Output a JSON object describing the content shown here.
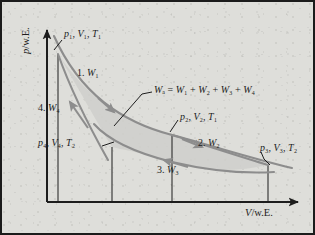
{
  "figure": {
    "kind": "carnot-cycle-pv-diagram",
    "background_color": "#dededa",
    "border_color": "#1b1b1b",
    "curve_color": "#8d8d8d",
    "axis_color": "#1d1d1d",
    "fill_color": "#cfcfcb"
  },
  "axes": {
    "y_label": "p/w.E.",
    "x_label": "V/w.E."
  },
  "states": {
    "p1": "p₁, V₁, T₁",
    "p2": "p₂, V₂, T₁",
    "p3": "p₃, V₃, T₂",
    "p4": "p₄, V₄, T₂"
  },
  "steps": {
    "w1": "1. W₁",
    "w2": "2. W₂",
    "w3": "3. W₃",
    "w4": "4. W₄"
  },
  "equation": "Wₐ = W₁ + W₂ + W₃ + W₄",
  "chart_data": {
    "type": "line",
    "xlabel": "V/w.E.",
    "ylabel": "p/w.E.",
    "grid": false,
    "legend": "none",
    "axis_origin_px": [
      45,
      200
    ],
    "points": [
      {
        "name": "1",
        "label": "p₁, V₁, T₁",
        "px": [
          56,
          52
        ]
      },
      {
        "name": "2",
        "label": "p₂, V₂, T₁",
        "px": [
          170,
          133
        ]
      },
      {
        "name": "3",
        "label": "p₃, V₃, T₂",
        "px": [
          266,
          163
        ]
      },
      {
        "name": "4",
        "label": "p₄, V₄, T₂",
        "px": [
          110,
          145
        ]
      }
    ],
    "series": [
      {
        "name": "1. W₁",
        "process": "isothermal expansion T₁",
        "from": "1",
        "to": "2",
        "direction": "forward"
      },
      {
        "name": "2. W₂",
        "process": "adiabatic expansion",
        "from": "2",
        "to": "3",
        "direction": "forward"
      },
      {
        "name": "3. W₃",
        "process": "isothermal compression T₂",
        "from": "3",
        "to": "4",
        "direction": "reverse"
      },
      {
        "name": "4. W₄",
        "process": "adiabatic compression",
        "from": "4",
        "to": "1",
        "direction": "reverse"
      }
    ],
    "drop_lines_px_x": [
      56,
      110,
      170,
      266
    ],
    "annotation": "Wₐ = W₁ + W₂ + W₃ + W₄"
  }
}
